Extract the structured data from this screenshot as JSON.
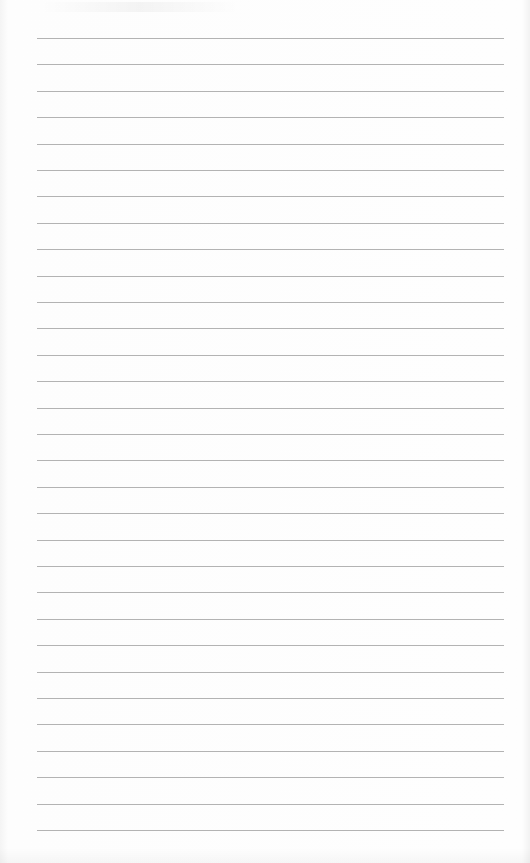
{
  "page": {
    "type": "lined-notebook-paper",
    "line_count": 31,
    "first_line_y": 38,
    "line_spacing": 26.4,
    "line_left": 37,
    "line_right": 504,
    "line_color": "#9a9a9a",
    "paper_color": "#fdfdfd"
  }
}
